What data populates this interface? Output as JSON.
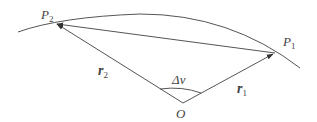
{
  "diagram": {
    "colors": {
      "stroke": "#555555",
      "text": "#444444",
      "background": "#ffffff"
    },
    "points": {
      "P2": {
        "label": "P",
        "sub": "2",
        "x": 55,
        "y": 23
      },
      "P1": {
        "label": "P",
        "sub": "1",
        "x": 275,
        "y": 53
      },
      "O": {
        "label": "O",
        "x": 183,
        "y": 103
      }
    },
    "vectors": {
      "r2": {
        "label": "r",
        "sub": "2",
        "from": "O",
        "to": "P2"
      },
      "r1": {
        "label": "r",
        "sub": "1",
        "from": "O",
        "to": "P1"
      },
      "chord": {
        "from": "P1",
        "to": "P2"
      }
    },
    "angle": {
      "label": "Δν",
      "between": [
        "r2",
        "r1"
      ]
    },
    "orbit_arc": {
      "description": "conic arc passing through P2 and P1"
    }
  }
}
